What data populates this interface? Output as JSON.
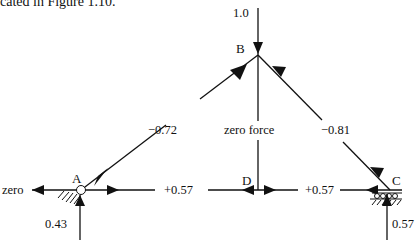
{
  "caption": "cated in Figure 1.10.",
  "nodes": {
    "A": "A",
    "B": "B",
    "C": "C",
    "D": "D"
  },
  "loads": {
    "applied_at_B": "1.0",
    "reaction_A_horizontal": "zero",
    "reaction_A_vertical": "0.43",
    "reaction_C_vertical": "0.57"
  },
  "members": {
    "AB": "−0.72",
    "BC": "−0.81",
    "BD": "zero force",
    "AD": "+0.57",
    "DC": "+0.57"
  },
  "colors": {
    "line": "#111111",
    "background": "#ffffff"
  }
}
